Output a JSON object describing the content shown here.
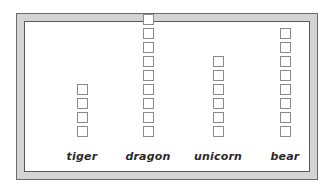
{
  "chart_data": {
    "type": "bar",
    "title": "",
    "xlabel": "",
    "ylabel": "",
    "categories": [
      "tiger",
      "dragon",
      "unicorn",
      "bear"
    ],
    "values": [
      4,
      9,
      6,
      8
    ],
    "unit": "squares (pictograph)",
    "grid": false,
    "legend": null
  },
  "labels": {
    "tiger": "tiger",
    "dragon": "dragon",
    "unicorn": "unicorn",
    "bear": "bear"
  },
  "colors": {
    "frame_band": "#d4d4d4",
    "frame_border": "#6a6a6a",
    "square_border": "#8a8a8a",
    "label_text": "#2a2a2a"
  }
}
